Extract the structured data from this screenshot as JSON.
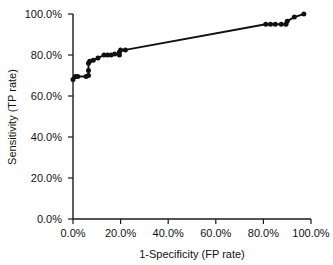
{
  "chart_data": {
    "type": "line",
    "title": "",
    "subtitle": "",
    "xlabel": "1-Specificity (FP rate)",
    "ylabel": "Sensitivity (TP rate)",
    "xlim": [
      0,
      100
    ],
    "ylim": [
      0,
      100
    ],
    "grid": false,
    "legend": null,
    "legend_position": "none",
    "x_tick_labels": [
      "0.0%",
      "20.0%",
      "40.0%",
      "60.0%",
      "80.0%",
      "100.0%"
    ],
    "x_tick_values": [
      0,
      20,
      40,
      60,
      80,
      100
    ],
    "y_tick_labels": [
      "0.0%",
      "20.0%",
      "40.0%",
      "60.0%",
      "80.0%",
      "100.0%"
    ],
    "y_tick_values": [
      0,
      20,
      40,
      60,
      80,
      100
    ],
    "series": [
      {
        "name": "ROC curve",
        "marker": "filled-circle",
        "color": "#101010",
        "x": [
          0.0,
          1.0,
          2.0,
          5.5,
          6.5,
          6.5,
          6.5,
          7.0,
          8.5,
          10.5,
          13.0,
          14.5,
          16.0,
          17.5,
          19.5,
          19.5,
          20.0,
          22.0,
          81.0,
          83.0,
          85.0,
          87.5,
          89.5,
          90.0,
          93.0,
          97.0
        ],
        "y": [
          68.0,
          69.5,
          69.5,
          69.5,
          70.0,
          72.5,
          76.0,
          77.0,
          77.5,
          78.5,
          80.0,
          80.0,
          80.0,
          80.5,
          80.0,
          81.5,
          82.5,
          82.5,
          95.0,
          95.0,
          95.0,
          95.0,
          95.0,
          96.5,
          98.5,
          100.0
        ]
      }
    ]
  },
  "axes": {
    "x_title": "1-Specificity (FP rate)",
    "y_title": "Sensitivity (TP rate)"
  },
  "colors": {
    "curve": "#101010",
    "axis": "#1a1a1a",
    "background": "#ffffff",
    "text": "#111111"
  }
}
